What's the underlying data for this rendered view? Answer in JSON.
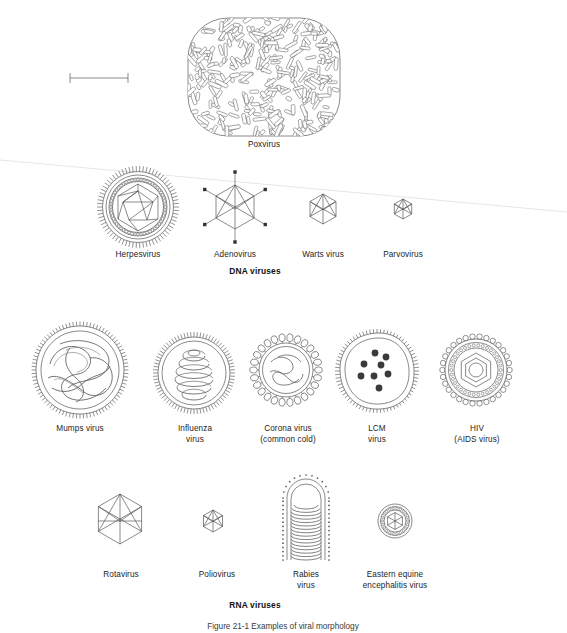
{
  "figure": {
    "caption": "Figure 21-1 Examples of viral morphology",
    "scale_bar": {
      "name": "scale-bar",
      "label": ""
    }
  },
  "groups": [
    {
      "id": "dna",
      "heading": "DNA viruses"
    },
    {
      "id": "rna",
      "heading": "RNA viruses"
    }
  ],
  "viruses": [
    {
      "id": "poxvirus",
      "label": "Poxvirus",
      "shape": "brick",
      "group": "dna"
    },
    {
      "id": "herpesvirus",
      "label": "Herpesvirus",
      "shape": "enveloped-icosahedral",
      "group": "dna"
    },
    {
      "id": "adenovirus",
      "label": "Adenovirus",
      "shape": "icosahedral-fibers",
      "group": "dna"
    },
    {
      "id": "warts",
      "label": "Warts virus",
      "shape": "icosahedral",
      "group": "dna"
    },
    {
      "id": "parvovirus",
      "label": "Parvovirus",
      "shape": "icosahedral-small",
      "group": "dna"
    },
    {
      "id": "mumps",
      "label": "Mumps virus",
      "shape": "helical-tangled",
      "group": "rna"
    },
    {
      "id": "influenza",
      "label": "Influenza\nvirus",
      "shape": "helical-coil",
      "group": "rna"
    },
    {
      "id": "corona",
      "label": "Corona virus\n(common cold)",
      "shape": "club-spikes",
      "group": "rna"
    },
    {
      "id": "lcm",
      "label": "LCM\nvirus",
      "shape": "granular",
      "group": "rna"
    },
    {
      "id": "hiv",
      "label": "HIV\n(AIDS virus)",
      "shape": "concentric",
      "group": "rna"
    },
    {
      "id": "rotavirus",
      "label": "Rotavirus",
      "shape": "icosahedral",
      "group": "rna"
    },
    {
      "id": "poliovirus",
      "label": "Poliovirus",
      "shape": "icosahedral-small",
      "group": "rna"
    },
    {
      "id": "rabies",
      "label": "Rabies\nvirus",
      "shape": "bullet",
      "group": "rna"
    },
    {
      "id": "eee",
      "label": "Eastern equine\nencephalitis virus",
      "shape": "concentric-small",
      "group": "rna"
    }
  ]
}
